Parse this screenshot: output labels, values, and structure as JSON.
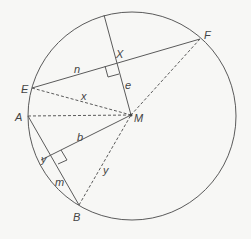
{
  "diagram": {
    "type": "circle-geometry",
    "colors": {
      "stroke": "#5a5a5a",
      "background": "#f7f7f5",
      "text": "#444444"
    },
    "circle": {
      "cx": 132,
      "cy": 116,
      "r": 104
    },
    "points": {
      "M": {
        "label": "M",
        "x": 131,
        "y": 115
      },
      "E": {
        "label": "E",
        "x": 32,
        "y": 88
      },
      "F": {
        "label": "F",
        "x": 200,
        "y": 39
      },
      "A": {
        "label": "A",
        "x": 28,
        "y": 116
      },
      "B": {
        "label": "B",
        "x": 79,
        "y": 205
      },
      "X": {
        "label": "X",
        "x": 117,
        "y": 62
      }
    },
    "segment_labels": {
      "n": "n",
      "e": "e",
      "x": "x",
      "b": "b",
      "y_chord": "y",
      "y_radius": "y",
      "m": "m"
    }
  }
}
